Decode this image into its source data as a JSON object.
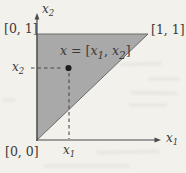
{
  "figure": {
    "type": "geometry-diagram",
    "region": "shaded right triangle with vertices [0,0], [0,1], [1,1]",
    "point": {
      "x": "x1",
      "y": "x2"
    }
  },
  "colors": {
    "paper": "#f3f1ec",
    "region_fill": "#a9a9a9",
    "region_stroke": "#6a6a6a",
    "axis": "#4a4a4a",
    "text": "#3a3a3a",
    "point": "#1e1e1e"
  },
  "labels": {
    "x1_axis": {
      "base": "x",
      "sub": "1"
    },
    "x2_axis": {
      "base": "x",
      "sub": "2"
    },
    "x1_tick": {
      "base": "x",
      "sub": "1"
    },
    "x2_tick": {
      "base": "x",
      "sub": "2"
    },
    "corner_top_left": "[0, 1]",
    "corner_top_right": "[1, 1]",
    "corner_origin": "[0, 0]",
    "point_label": {
      "var": "x",
      "eq": " = [",
      "v1": "x",
      "v1sub": "1",
      "sep": ", ",
      "v2": "x",
      "v2sub": "2",
      "post": "]"
    }
  }
}
